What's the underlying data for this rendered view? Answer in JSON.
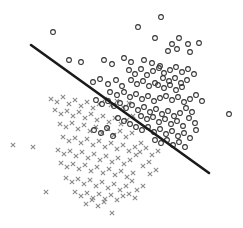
{
  "figure": {
    "width": 243,
    "height": 228,
    "background_color": "#ffffff",
    "has_axes": false,
    "has_gridlines": false,
    "has_legend": false,
    "has_title": false,
    "has_tick_labels": false
  },
  "chart_data": {
    "type": "scatter",
    "title": "",
    "subtitle": "",
    "xlabel": "",
    "ylabel": "",
    "xlim": [
      0,
      243
    ],
    "ylim": [
      228,
      0
    ],
    "grid": false,
    "legend_position": "none",
    "axis_visible": false,
    "tick_labels": {
      "x": [],
      "y": []
    },
    "annotations": [],
    "marker_styles": {
      "circle": {
        "shape": "open-circle",
        "radius": 2.4,
        "color": "#333333",
        "fill": "none",
        "stroke_width": 1.05
      },
      "cross": {
        "shape": "x",
        "size": 4.4,
        "color": "#8a8a8a",
        "stroke_width": 1.05
      }
    },
    "decision_boundary": {
      "label": "decision boundary",
      "type": "line",
      "color": "#1a1a1a",
      "stroke_width": 2.6,
      "x1": 31,
      "y1": 45,
      "x2": 209,
      "y2": 173,
      "slope_screen": 0.719,
      "intercept_screen": 22.7
    },
    "series": [
      {
        "name": "class-circle",
        "marker": "circle",
        "color": "#333333",
        "count": 118,
        "points": [
          [
            161,
            17
          ],
          [
            138,
            27
          ],
          [
            53,
            32
          ],
          [
            155,
            38
          ],
          [
            179,
            38
          ],
          [
            172,
            44
          ],
          [
            188,
            44
          ],
          [
            199,
            43
          ],
          [
            69,
            60
          ],
          [
            81,
            62
          ],
          [
            104,
            60
          ],
          [
            112,
            64
          ],
          [
            124,
            58
          ],
          [
            131,
            62
          ],
          [
            168,
            51
          ],
          [
            177,
            49
          ],
          [
            190,
            52
          ],
          [
            144,
            60
          ],
          [
            152,
            63
          ],
          [
            160,
            66
          ],
          [
            93,
            82
          ],
          [
            100,
            79
          ],
          [
            108,
            84
          ],
          [
            116,
            80
          ],
          [
            122,
            86
          ],
          [
            129,
            70
          ],
          [
            135,
            74
          ],
          [
            141,
            69
          ],
          [
            147,
            75
          ],
          [
            153,
            71
          ],
          [
            159,
            68
          ],
          [
            164,
            73
          ],
          [
            170,
            70
          ],
          [
            176,
            67
          ],
          [
            182,
            72
          ],
          [
            188,
            69
          ],
          [
            194,
            74
          ],
          [
            163,
            78
          ],
          [
            169,
            81
          ],
          [
            175,
            78
          ],
          [
            181,
            83
          ],
          [
            187,
            80
          ],
          [
            158,
            85
          ],
          [
            164,
            88
          ],
          [
            170,
            85
          ],
          [
            176,
            90
          ],
          [
            182,
            87
          ],
          [
            131,
            80
          ],
          [
            137,
            84
          ],
          [
            143,
            81
          ],
          [
            149,
            86
          ],
          [
            155,
            83
          ],
          [
            110,
            92
          ],
          [
            117,
            95
          ],
          [
            124,
            92
          ],
          [
            130,
            97
          ],
          [
            136,
            94
          ],
          [
            142,
            99
          ],
          [
            148,
            96
          ],
          [
            154,
            101
          ],
          [
            160,
            98
          ],
          [
            166,
            96
          ],
          [
            172,
            100
          ],
          [
            178,
            97
          ],
          [
            184,
            102
          ],
          [
            190,
            99
          ],
          [
            196,
            95
          ],
          [
            202,
            101
          ],
          [
            96,
            100
          ],
          [
            102,
            104
          ],
          [
            108,
            101
          ],
          [
            114,
            106
          ],
          [
            120,
            103
          ],
          [
            126,
            108
          ],
          [
            132,
            105
          ],
          [
            138,
            110
          ],
          [
            144,
            107
          ],
          [
            150,
            112
          ],
          [
            156,
            109
          ],
          [
            162,
            114
          ],
          [
            168,
            111
          ],
          [
            174,
            116
          ],
          [
            180,
            113
          ],
          [
            186,
            108
          ],
          [
            192,
            112
          ],
          [
            229,
            114
          ],
          [
            141,
            116
          ],
          [
            147,
            119
          ],
          [
            153,
            117
          ],
          [
            159,
            122
          ],
          [
            165,
            119
          ],
          [
            171,
            124
          ],
          [
            177,
            121
          ],
          [
            183,
            126
          ],
          [
            189,
            118
          ],
          [
            195,
            123
          ],
          [
            118,
            118
          ],
          [
            124,
            121
          ],
          [
            130,
            124
          ],
          [
            136,
            127
          ],
          [
            142,
            130
          ],
          [
            148,
            127
          ],
          [
            154,
            132
          ],
          [
            160,
            129
          ],
          [
            166,
            134
          ],
          [
            172,
            131
          ],
          [
            178,
            136
          ],
          [
            184,
            133
          ],
          [
            190,
            138
          ],
          [
            196,
            130
          ],
          [
            155,
            140
          ],
          [
            161,
            143
          ],
          [
            167,
            140
          ],
          [
            173,
            145
          ],
          [
            179,
            142
          ],
          [
            185,
            147
          ],
          [
            94,
            130
          ],
          [
            101,
            133
          ],
          [
            107,
            128
          ],
          [
            113,
            136
          ]
        ]
      },
      {
        "name": "class-cross",
        "marker": "cross",
        "color": "#8a8a8a",
        "count": 122,
        "points": [
          [
            13,
            145
          ],
          [
            33,
            147
          ],
          [
            46,
            192
          ],
          [
            112,
            213
          ],
          [
            51,
            99
          ],
          [
            57,
            102
          ],
          [
            63,
            97
          ],
          [
            69,
            104
          ],
          [
            75,
            100
          ],
          [
            81,
            106
          ],
          [
            87,
            102
          ],
          [
            93,
            108
          ],
          [
            99,
            104
          ],
          [
            105,
            99
          ],
          [
            111,
            105
          ],
          [
            117,
            101
          ],
          [
            123,
            107
          ],
          [
            129,
            103
          ],
          [
            55,
            110
          ],
          [
            61,
            114
          ],
          [
            67,
            111
          ],
          [
            73,
            116
          ],
          [
            79,
            112
          ],
          [
            85,
            118
          ],
          [
            91,
            114
          ],
          [
            97,
            120
          ],
          [
            103,
            116
          ],
          [
            109,
            122
          ],
          [
            115,
            118
          ],
          [
            121,
            124
          ],
          [
            127,
            120
          ],
          [
            133,
            116
          ],
          [
            60,
            124
          ],
          [
            66,
            127
          ],
          [
            72,
            123
          ],
          [
            78,
            129
          ],
          [
            84,
            125
          ],
          [
            90,
            131
          ],
          [
            96,
            127
          ],
          [
            102,
            133
          ],
          [
            108,
            129
          ],
          [
            114,
            135
          ],
          [
            120,
            131
          ],
          [
            126,
            137
          ],
          [
            132,
            133
          ],
          [
            63,
            137
          ],
          [
            69,
            141
          ],
          [
            75,
            138
          ],
          [
            81,
            143
          ],
          [
            87,
            139
          ],
          [
            93,
            145
          ],
          [
            99,
            141
          ],
          [
            105,
            147
          ],
          [
            111,
            143
          ],
          [
            117,
            149
          ],
          [
            123,
            145
          ],
          [
            129,
            151
          ],
          [
            135,
            147
          ],
          [
            141,
            143
          ],
          [
            58,
            150
          ],
          [
            64,
            154
          ],
          [
            70,
            151
          ],
          [
            76,
            156
          ],
          [
            82,
            152
          ],
          [
            88,
            158
          ],
          [
            94,
            154
          ],
          [
            100,
            160
          ],
          [
            106,
            156
          ],
          [
            112,
            162
          ],
          [
            118,
            158
          ],
          [
            124,
            164
          ],
          [
            130,
            160
          ],
          [
            136,
            155
          ],
          [
            61,
            163
          ],
          [
            67,
            167
          ],
          [
            73,
            164
          ],
          [
            79,
            169
          ],
          [
            85,
            165
          ],
          [
            91,
            171
          ],
          [
            97,
            167
          ],
          [
            103,
            173
          ],
          [
            109,
            169
          ],
          [
            115,
            175
          ],
          [
            121,
            171
          ],
          [
            127,
            177
          ],
          [
            133,
            173
          ],
          [
            66,
            178
          ],
          [
            72,
            182
          ],
          [
            78,
            179
          ],
          [
            84,
            184
          ],
          [
            90,
            180
          ],
          [
            96,
            186
          ],
          [
            102,
            182
          ],
          [
            108,
            188
          ],
          [
            114,
            184
          ],
          [
            120,
            190
          ],
          [
            126,
            186
          ],
          [
            132,
            181
          ],
          [
            75,
            192
          ],
          [
            81,
            196
          ],
          [
            87,
            193
          ],
          [
            93,
            198
          ],
          [
            99,
            194
          ],
          [
            105,
            199
          ],
          [
            111,
            195
          ],
          [
            117,
            200
          ],
          [
            123,
            196
          ],
          [
            140,
            152
          ],
          [
            146,
            148
          ],
          [
            152,
            155
          ],
          [
            158,
            151
          ],
          [
            143,
            166
          ],
          [
            149,
            162
          ],
          [
            137,
            190
          ],
          [
            143,
            186
          ],
          [
            150,
            174
          ],
          [
            156,
            170
          ],
          [
            129,
            194
          ],
          [
            135,
            198
          ],
          [
            86,
            204
          ],
          [
            92,
            200
          ],
          [
            98,
            206
          ],
          [
            104,
            202
          ]
        ]
      }
    ]
  }
}
